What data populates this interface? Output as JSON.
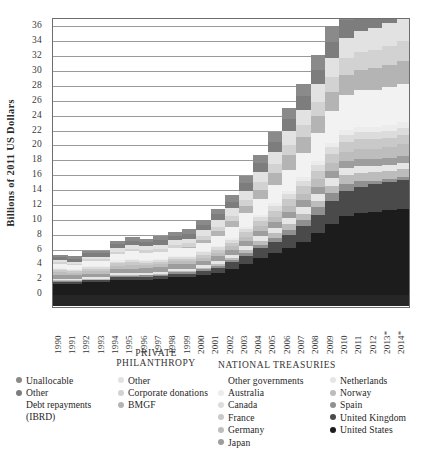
{
  "chart": {
    "type": "area",
    "ylabel": "Billions of 2011 US Dollars",
    "xlabel": ""
  },
  "yaxis": {
    "ticks": [
      0,
      2,
      4,
      6,
      8,
      10,
      12,
      14,
      16,
      18,
      20,
      22,
      24,
      26,
      28,
      30,
      32,
      34,
      36
    ],
    "min": -2,
    "max": 37
  },
  "legend": {
    "headers": [
      {
        "line1": "PRIVATE",
        "line2": "PHILANTHROPY"
      },
      {
        "line1": "",
        "line2": "NATIONAL TREASURIES"
      }
    ],
    "col1": [
      {
        "label": "Unallocable",
        "color": "#8a8a8a",
        "swatch": true
      },
      {
        "label": "Other",
        "color": "#7d7d7d",
        "swatch": true
      }
    ],
    "col1_sub": [
      "Debt repayments",
      "(IBRD)"
    ],
    "col2": [
      {
        "label": "Other",
        "color": "#e2e2e2",
        "swatch": true
      },
      {
        "label": "Corporate donations",
        "color": "#d2d2d2",
        "swatch": true
      },
      {
        "label": "BMGF",
        "color": "#b4b4b4",
        "swatch": true
      }
    ],
    "col3": [
      {
        "label": "Other governments",
        "color": "",
        "swatch": false
      },
      {
        "label": "Australia",
        "color": "#ececec",
        "swatch": true
      },
      {
        "label": "Canada",
        "color": "#dcdcdc",
        "swatch": true
      },
      {
        "label": "France",
        "color": "#c9c9c9",
        "swatch": true
      },
      {
        "label": "Germany",
        "color": "#bdbdbd",
        "swatch": true
      },
      {
        "label": "Japan",
        "color": "#9d9d9d",
        "swatch": true
      }
    ],
    "col4": [
      {
        "label": "Netherlands",
        "color": "#e6e6e6",
        "swatch": true
      },
      {
        "label": "Norway",
        "color": "#bcbcbc",
        "swatch": true
      },
      {
        "label": "Spain",
        "color": "#909090",
        "swatch": true
      },
      {
        "label": "United Kingdom",
        "color": "#4a4a4a",
        "swatch": true
      },
      {
        "label": "United States",
        "color": "#1c1c1c",
        "swatch": true
      }
    ]
  },
  "chart_data": {
    "type": "area",
    "title": "",
    "xlabel": "",
    "ylabel": "Billions of 2011 US Dollars",
    "ylim": [
      -2,
      37
    ],
    "grid": true,
    "legend_position": "bottom",
    "categories": [
      "1990",
      "1991",
      "1992",
      "1993",
      "1994",
      "1995",
      "1996",
      "1997",
      "1998",
      "1999",
      "2000",
      "2001",
      "2002",
      "2003",
      "2004",
      "2005",
      "2006",
      "2007",
      "2008",
      "2009",
      "2010",
      "2011",
      "2012",
      "2013*",
      "2014*"
    ],
    "series": [
      {
        "name": "Debt repayments (IBRD)",
        "color": "#262626",
        "values": [
          -1.6,
          -1.6,
          -1.6,
          -1.6,
          -1.6,
          -1.6,
          -1.6,
          -1.6,
          -1.6,
          -1.6,
          -1.6,
          -1.6,
          -1.6,
          -1.6,
          -1.6,
          -1.6,
          -1.6,
          -1.6,
          -1.6,
          -1.6,
          -1.6,
          -1.6,
          -1.6,
          -1.6,
          -1.6
        ]
      },
      {
        "name": "United States",
        "color": "#1c1c1c",
        "values": [
          1.5,
          1.5,
          1.7,
          1.7,
          2.0,
          2.0,
          2.1,
          2.2,
          2.4,
          2.4,
          2.7,
          3.0,
          3.5,
          4.2,
          5.0,
          5.6,
          6.3,
          7.2,
          8.3,
          9.6,
          10.6,
          11.0,
          11.2,
          11.4,
          11.6
        ]
      },
      {
        "name": "United Kingdom",
        "color": "#4a4a4a",
        "values": [
          0.3,
          0.3,
          0.3,
          0.3,
          0.4,
          0.4,
          0.4,
          0.4,
          0.5,
          0.5,
          0.6,
          0.7,
          0.9,
          1.1,
          1.3,
          1.5,
          1.8,
          2.1,
          2.5,
          3.0,
          3.4,
          3.6,
          3.7,
          3.8,
          3.9
        ]
      },
      {
        "name": "Spain",
        "color": "#909090",
        "values": [
          0.1,
          0.1,
          0.1,
          0.1,
          0.15,
          0.15,
          0.15,
          0.15,
          0.2,
          0.2,
          0.2,
          0.25,
          0.3,
          0.4,
          0.5,
          0.6,
          0.7,
          0.85,
          1.0,
          1.1,
          1.0,
          0.7,
          0.5,
          0.4,
          0.4
        ]
      },
      {
        "name": "Norway",
        "color": "#bcbcbc",
        "values": [
          0.1,
          0.1,
          0.1,
          0.1,
          0.12,
          0.12,
          0.12,
          0.15,
          0.15,
          0.15,
          0.2,
          0.25,
          0.3,
          0.4,
          0.5,
          0.6,
          0.7,
          0.8,
          0.9,
          1.0,
          1.1,
          1.1,
          1.1,
          1.1,
          1.1
        ]
      },
      {
        "name": "Netherlands",
        "color": "#e6e6e6",
        "values": [
          0.2,
          0.2,
          0.2,
          0.2,
          0.25,
          0.25,
          0.25,
          0.25,
          0.3,
          0.3,
          0.35,
          0.4,
          0.45,
          0.55,
          0.65,
          0.75,
          0.85,
          0.9,
          0.95,
          1.0,
          1.0,
          0.95,
          0.85,
          0.8,
          0.8
        ]
      },
      {
        "name": "Japan",
        "color": "#9d9d9d",
        "values": [
          0.5,
          0.45,
          0.5,
          0.5,
          0.6,
          0.65,
          0.6,
          0.6,
          0.6,
          0.6,
          0.6,
          0.6,
          0.6,
          0.65,
          0.7,
          0.8,
          0.85,
          0.9,
          0.95,
          1.0,
          1.0,
          1.0,
          0.95,
          0.9,
          0.9
        ]
      },
      {
        "name": "Germany",
        "color": "#bdbdbd",
        "values": [
          0.35,
          0.3,
          0.35,
          0.35,
          0.4,
          0.45,
          0.4,
          0.4,
          0.4,
          0.4,
          0.4,
          0.45,
          0.5,
          0.55,
          0.6,
          0.7,
          0.8,
          0.9,
          1.0,
          1.1,
          1.2,
          1.3,
          1.4,
          1.5,
          1.6
        ]
      },
      {
        "name": "France",
        "color": "#c9c9c9",
        "values": [
          0.3,
          0.25,
          0.3,
          0.3,
          0.35,
          0.4,
          0.35,
          0.35,
          0.35,
          0.35,
          0.4,
          0.45,
          0.5,
          0.6,
          0.7,
          0.8,
          0.9,
          1.0,
          1.1,
          1.2,
          1.3,
          1.3,
          1.3,
          1.3,
          1.3
        ]
      },
      {
        "name": "Canada",
        "color": "#dcdcdc",
        "values": [
          0.2,
          0.18,
          0.2,
          0.2,
          0.25,
          0.3,
          0.25,
          0.25,
          0.25,
          0.25,
          0.3,
          0.35,
          0.4,
          0.45,
          0.5,
          0.6,
          0.65,
          0.7,
          0.8,
          0.9,
          0.95,
          0.95,
          0.9,
          0.9,
          0.9
        ]
      },
      {
        "name": "Australia",
        "color": "#ececec",
        "values": [
          0.1,
          0.1,
          0.12,
          0.12,
          0.15,
          0.18,
          0.15,
          0.15,
          0.15,
          0.15,
          0.2,
          0.22,
          0.25,
          0.3,
          0.35,
          0.4,
          0.45,
          0.5,
          0.55,
          0.6,
          0.7,
          0.75,
          0.75,
          0.75,
          0.75
        ]
      },
      {
        "name": "Other governments",
        "color": "#f2f2f2",
        "values": [
          0.6,
          0.55,
          0.7,
          0.7,
          0.9,
          1.0,
          0.95,
          0.95,
          1.0,
          1.0,
          1.1,
          1.3,
          1.5,
          1.8,
          2.1,
          2.5,
          2.9,
          3.3,
          3.8,
          4.3,
          4.7,
          4.9,
          5.0,
          5.1,
          5.2
        ]
      },
      {
        "name": "BMGF",
        "color": "#b4b4b4",
        "values": [
          0,
          0,
          0,
          0,
          0,
          0,
          0,
          0,
          0.1,
          0.2,
          0.4,
          0.6,
          0.8,
          1.0,
          1.3,
          1.6,
          1.9,
          2.1,
          2.3,
          2.5,
          2.7,
          2.8,
          2.9,
          3.0,
          3.1
        ]
      },
      {
        "name": "Corporate donations",
        "color": "#d2d2d2",
        "values": [
          0.2,
          0.2,
          0.25,
          0.25,
          0.3,
          0.35,
          0.35,
          0.4,
          0.4,
          0.45,
          0.5,
          0.6,
          0.7,
          0.85,
          1.0,
          1.2,
          1.4,
          1.6,
          1.8,
          2.0,
          2.2,
          2.3,
          2.4,
          2.5,
          2.6
        ]
      },
      {
        "name": "Other (philanthropy)",
        "color": "#e2e2e2",
        "values": [
          0.3,
          0.3,
          0.35,
          0.35,
          0.45,
          0.5,
          0.5,
          0.55,
          0.6,
          0.65,
          0.75,
          0.9,
          1.0,
          1.2,
          1.4,
          1.6,
          1.9,
          2.1,
          2.4,
          2.6,
          2.8,
          2.9,
          3.0,
          3.1,
          3.2
        ]
      },
      {
        "name": "Other",
        "color": "#7d7d7d",
        "values": [
          0.4,
          0.4,
          0.45,
          0.45,
          0.5,
          0.55,
          0.55,
          0.6,
          0.6,
          0.65,
          0.7,
          0.8,
          0.9,
          1.0,
          1.2,
          1.4,
          1.6,
          1.8,
          2.0,
          2.2,
          2.3,
          2.4,
          2.4,
          2.5,
          2.5
        ]
      },
      {
        "name": "Unallocable",
        "color": "#8a8a8a",
        "values": [
          0.3,
          0.3,
          0.35,
          0.35,
          0.45,
          0.5,
          0.5,
          0.5,
          0.55,
          0.6,
          0.65,
          0.75,
          0.85,
          1.0,
          1.1,
          1.3,
          1.5,
          1.7,
          1.9,
          2.1,
          2.2,
          2.3,
          2.3,
          2.4,
          2.4
        ]
      }
    ]
  }
}
